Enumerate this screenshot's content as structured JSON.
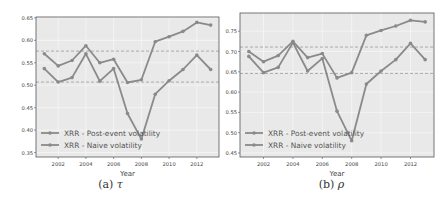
{
  "chart_data": [
    {
      "type": "line",
      "title": "",
      "xlabel": "Year",
      "ylabel": "",
      "x": [
        2001,
        2002,
        2003,
        2004,
        2005,
        2006,
        2007,
        2008,
        2009,
        2010,
        2011,
        2012,
        2013
      ],
      "xticks": [
        2002,
        2004,
        2006,
        2008,
        2010,
        2012
      ],
      "ylim": [
        0.34,
        0.652
      ],
      "yticks": [
        "0.35",
        "0.40",
        "0.45",
        "0.50",
        "0.55",
        "0.60",
        "0.65"
      ],
      "grid": true,
      "legend_position": "lower left",
      "series": [
        {
          "name": "XRR - Post-event volatility",
          "values": [
            0.57,
            0.543,
            0.555,
            0.588,
            0.55,
            0.558,
            0.506,
            0.512,
            0.597,
            0.608,
            0.62,
            0.64,
            0.634
          ]
        },
        {
          "name": "XRR - Naive volatility",
          "values": [
            0.537,
            0.507,
            0.517,
            0.57,
            0.509,
            0.537,
            0.437,
            0.38,
            0.48,
            0.51,
            0.535,
            0.567,
            0.535
          ]
        }
      ],
      "reference_lines": [
        0.576,
        0.507
      ],
      "caption_label": "(a)",
      "caption_symbol": "τ"
    },
    {
      "type": "line",
      "title": "",
      "xlabel": "Year",
      "ylabel": "",
      "x": [
        2001,
        2002,
        2003,
        2004,
        2005,
        2006,
        2007,
        2008,
        2009,
        2010,
        2011,
        2012,
        2013
      ],
      "xticks": [
        2002,
        2004,
        2006,
        2008,
        2010,
        2012
      ],
      "ylim": [
        0.44,
        0.795
      ],
      "yticks": [
        "0.45",
        "0.50",
        "0.55",
        "0.60",
        "0.65",
        "0.70",
        "0.75"
      ],
      "grid": true,
      "legend_position": "lower left",
      "series": [
        {
          "name": "XRR - Post-event volatility",
          "values": [
            0.7,
            0.675,
            0.69,
            0.725,
            0.685,
            0.695,
            0.635,
            0.648,
            0.74,
            0.752,
            0.763,
            0.777,
            0.773
          ]
        },
        {
          "name": "XRR - Naive volatility",
          "values": [
            0.688,
            0.648,
            0.661,
            0.722,
            0.652,
            0.683,
            0.553,
            0.48,
            0.62,
            0.652,
            0.68,
            0.72,
            0.68
          ]
        }
      ],
      "reference_lines": [
        0.711,
        0.646
      ],
      "caption_label": "(b)",
      "caption_symbol": "ρ"
    }
  ],
  "colors": {
    "plot_bg": "#e9e9e9",
    "grid": "#f6f6f6",
    "line": "#8a8a8a",
    "ref_line": "#9a9a9a",
    "axis_text": "#444444",
    "frame": "#555555"
  }
}
